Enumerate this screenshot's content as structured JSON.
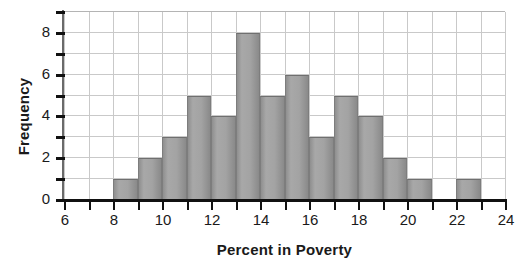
{
  "chart_data": {
    "type": "bar",
    "title": "",
    "subtitle": "",
    "xlabel": "Percent in Poverty",
    "ylabel": "Frequency",
    "xlim": [
      6,
      24
    ],
    "ylim": [
      0,
      9
    ],
    "bin_width": 1,
    "grid": true,
    "legend": null,
    "bar_color": "#a0a0a0",
    "bar_edge_color": "#6f6f6f",
    "grid_color": "#c9c9c9",
    "axis_color": "#111111",
    "text_color": "#1a1a1a",
    "x_tick_values": [
      6,
      7,
      8,
      9,
      10,
      11,
      12,
      13,
      14,
      15,
      16,
      17,
      18,
      19,
      20,
      21,
      22,
      23,
      24
    ],
    "x_tick_labels": [
      "6",
      "",
      "8",
      "",
      "10",
      "",
      "12",
      "",
      "14",
      "",
      "16",
      "",
      "18",
      "",
      "20",
      "",
      "22",
      "",
      "24"
    ],
    "y_tick_values": [
      0,
      1,
      2,
      3,
      4,
      5,
      6,
      7,
      8,
      9
    ],
    "y_tick_labels": [
      "0",
      "",
      "2",
      "",
      "4",
      "",
      "6",
      "",
      "8",
      ""
    ],
    "bins": [
      {
        "start": 8,
        "end": 9,
        "value": 1
      },
      {
        "start": 9,
        "end": 10,
        "value": 2
      },
      {
        "start": 10,
        "end": 11,
        "value": 3
      },
      {
        "start": 11,
        "end": 12,
        "value": 5
      },
      {
        "start": 12,
        "end": 13,
        "value": 4
      },
      {
        "start": 13,
        "end": 14,
        "value": 8
      },
      {
        "start": 14,
        "end": 15,
        "value": 5
      },
      {
        "start": 15,
        "end": 16,
        "value": 6
      },
      {
        "start": 16,
        "end": 17,
        "value": 3
      },
      {
        "start": 17,
        "end": 18,
        "value": 5
      },
      {
        "start": 18,
        "end": 19,
        "value": 4
      },
      {
        "start": 19,
        "end": 20,
        "value": 2
      },
      {
        "start": 20,
        "end": 21,
        "value": 1
      },
      {
        "start": 22,
        "end": 23,
        "value": 1
      }
    ],
    "categories": [
      "8-9",
      "9-10",
      "10-11",
      "11-12",
      "12-13",
      "13-14",
      "14-15",
      "15-16",
      "16-17",
      "17-18",
      "18-19",
      "19-20",
      "20-21",
      "21-22",
      "22-23"
    ],
    "values": [
      1,
      2,
      3,
      5,
      4,
      8,
      5,
      6,
      3,
      5,
      4,
      2,
      1,
      0,
      1
    ],
    "total_count": 45
  }
}
